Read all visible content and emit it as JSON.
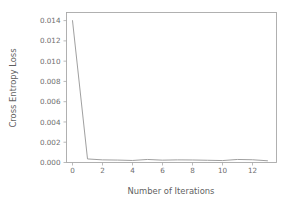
{
  "chart_data": {
    "type": "line",
    "title": "",
    "xlabel": "Number of Iterations",
    "ylabel": "Cross Entropy Loss",
    "xlim": [
      -0.4,
      13.6
    ],
    "ylim": [
      0.0,
      0.0148
    ],
    "grid": false,
    "legend": "none",
    "xticks": [
      0,
      2,
      4,
      6,
      8,
      10,
      12
    ],
    "xtick_labels": [
      "0",
      "2",
      "4",
      "6",
      "8",
      "10",
      "12"
    ],
    "yticks": [
      0.0,
      0.002,
      0.004,
      0.006,
      0.008,
      0.01,
      0.012,
      0.014
    ],
    "ytick_labels": [
      "0.000",
      "0.002",
      "0.004",
      "0.006",
      "0.008",
      "0.010",
      "0.012",
      "0.014"
    ],
    "series": [
      {
        "name": "Cross Entropy Loss",
        "color": "#9a9a9a",
        "x": [
          0,
          1,
          2,
          3,
          4,
          5,
          6,
          7,
          8,
          9,
          10,
          11,
          12,
          13
        ],
        "values": [
          0.014,
          0.00035,
          0.00026,
          0.00024,
          0.0002,
          0.0003,
          0.00023,
          0.00026,
          0.00025,
          0.00022,
          0.00019,
          0.0003,
          0.00027,
          0.00017
        ]
      }
    ]
  },
  "axis_label_texts": {
    "y_axis_title": "Cross Entropy Loss",
    "x_axis_title": "Number of Iterations"
  },
  "colors": {
    "background": "#ffffff",
    "frame": "#a8a8a8",
    "line": "#9a9a9a",
    "tick_text": "#6e6e6e",
    "axis_title_text": "#5f5f5f"
  }
}
